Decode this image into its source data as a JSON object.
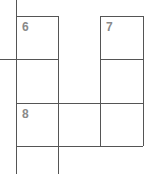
{
  "puzzle": {
    "type": "crossword-fragment",
    "clue_numbers": [
      {
        "id": "6",
        "label": "6"
      },
      {
        "id": "7",
        "label": "7"
      },
      {
        "id": "8",
        "label": "8"
      }
    ],
    "line_color": "#555555",
    "number_color": "#8a8a8a"
  }
}
